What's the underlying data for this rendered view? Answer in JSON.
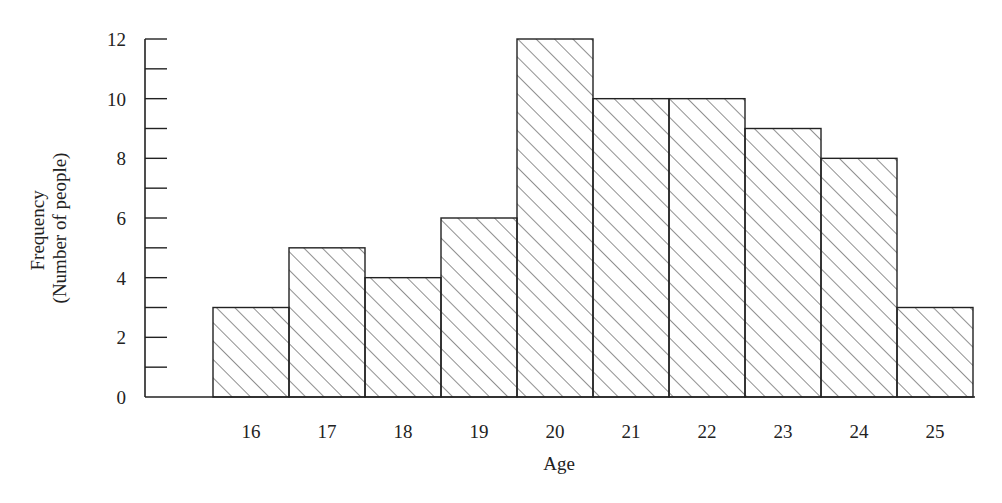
{
  "chart_data": {
    "type": "bar",
    "title": "",
    "xlabel": "Age",
    "ylabel_lines": [
      "Frequency",
      "(Number of people)"
    ],
    "ylabel": "Frequency (Number of people)",
    "categories": [
      "16",
      "17",
      "18",
      "19",
      "20",
      "21",
      "22",
      "23",
      "24",
      "25"
    ],
    "values": [
      3,
      5,
      4,
      6,
      12,
      10,
      10,
      9,
      8,
      3
    ],
    "ylim": [
      0,
      12
    ],
    "yticks_major": [
      0,
      2,
      4,
      6,
      8,
      10,
      12
    ],
    "yticks_minor_step": 1,
    "grid": false,
    "legend": null,
    "bar_style": "diagonal hatch, adjacent bars (histogram)"
  },
  "colors": {
    "ink": "#222222",
    "background": "#ffffff"
  }
}
